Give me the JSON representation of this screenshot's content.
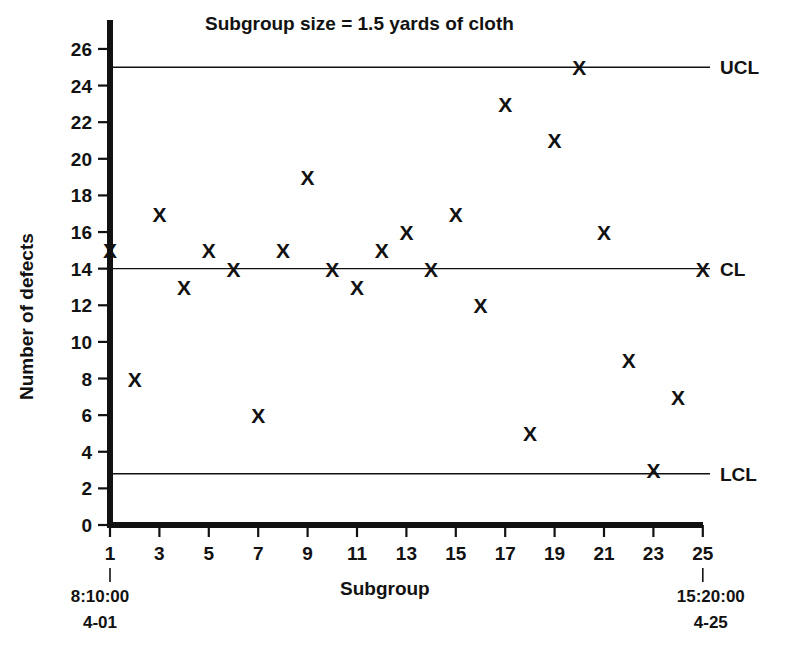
{
  "chart_data": {
    "type": "scatter",
    "title": "Subgroup size = 1.5 yards of cloth",
    "xlabel": "Subgroup",
    "ylabel": "Number of defects",
    "xlim": [
      0,
      26
    ],
    "ylim": [
      0,
      27
    ],
    "grid": false,
    "legend": "none",
    "x": [
      1,
      2,
      3,
      4,
      5,
      6,
      7,
      8,
      9,
      10,
      11,
      12,
      13,
      14,
      15,
      16,
      17,
      18,
      19,
      20,
      21,
      22,
      23,
      24,
      25
    ],
    "values": [
      15,
      8,
      17,
      13,
      15,
      14,
      6,
      15,
      19,
      14,
      13,
      15,
      16,
      14,
      17,
      12,
      23,
      5,
      21,
      25,
      16,
      9,
      3,
      7,
      14
    ],
    "marker": "X",
    "xticks": [
      1,
      3,
      5,
      7,
      9,
      11,
      13,
      15,
      17,
      19,
      21,
      23,
      25
    ],
    "xticklabels": [
      "1",
      "3",
      "5",
      "7",
      "9",
      "11",
      "13",
      "15",
      "17",
      "19",
      "21",
      "23",
      "25"
    ],
    "yticks": [
      0,
      2,
      4,
      6,
      8,
      10,
      12,
      14,
      16,
      18,
      20,
      22,
      24,
      26
    ],
    "yticklabels": [
      "0",
      "2",
      "4",
      "6",
      "8",
      "10",
      "12",
      "14",
      "16",
      "18",
      "20",
      "22",
      "24",
      "26"
    ],
    "control_limits": [
      {
        "name": "UCL",
        "label": "UCL",
        "value": 25
      },
      {
        "name": "CL",
        "label": "CL",
        "value": 14
      },
      {
        "name": "LCL",
        "label": "LCL",
        "value": 2.8
      }
    ],
    "annotations": [
      {
        "name": "start-time",
        "time": "8:10:00",
        "date": "4-01",
        "at_x": 1
      },
      {
        "name": "end-time",
        "time": "15:20:00",
        "date": "4-25",
        "at_x": 25
      }
    ]
  },
  "colors": {
    "ink": "#111111",
    "background": "#ffffff"
  }
}
